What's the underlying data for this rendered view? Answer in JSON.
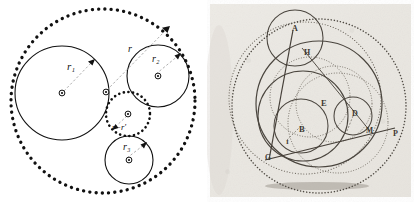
{
  "figure": {
    "panels": [
      "left-vector-diagram",
      "right-scanned-plate"
    ]
  },
  "left": {
    "name": "apollonian-radii-diagram",
    "stroke_color": "#111111",
    "dash_color": "#8a8a8a",
    "background": "#ffffff",
    "labels": {
      "r1": "r₁",
      "r2": "r₂",
      "r3": "r₃",
      "r_outer": "r",
      "r_middle": "r−r′"
    },
    "circles": [
      {
        "id": "outer-dotted",
        "label": "",
        "style": "dotted",
        "cx": 103,
        "cy": 101,
        "r": 92
      },
      {
        "id": "circle-r1",
        "label": "r₁",
        "style": "solid",
        "cx": 62,
        "cy": 93,
        "r": 47
      },
      {
        "id": "circle-r2",
        "label": "r₂",
        "style": "solid",
        "cx": 158,
        "cy": 76,
        "r": 31
      },
      {
        "id": "circle-r3",
        "label": "r₃",
        "style": "solid",
        "cx": 129,
        "cy": 160,
        "r": 24
      },
      {
        "id": "circle-middle-dotted",
        "label": "r−r′",
        "style": "dotted",
        "cx": 128,
        "cy": 114,
        "r": 22
      }
    ],
    "centers": [
      {
        "id": "center-r1",
        "cx": 62,
        "cy": 93
      },
      {
        "id": "center-outer",
        "cx": 106,
        "cy": 92
      },
      {
        "id": "center-r2",
        "cx": 158,
        "cy": 76
      },
      {
        "id": "center-middle",
        "cx": 128,
        "cy": 114
      },
      {
        "id": "center-r3",
        "cx": 129,
        "cy": 160
      }
    ]
  },
  "right": {
    "name": "scanned-geometric-plate",
    "background": "#f2f0ec",
    "ink_color": "#555049",
    "points": [
      {
        "label": "A",
        "x": 85,
        "y": 28
      },
      {
        "label": "H",
        "x": 97,
        "y": 52
      },
      {
        "label": "E",
        "x": 114,
        "y": 103
      },
      {
        "label": "B",
        "x": 94,
        "y": 129
      },
      {
        "label": "D",
        "x": 146,
        "y": 113
      },
      {
        "label": "M",
        "x": 160,
        "y": 130
      },
      {
        "label": "P",
        "x": 187,
        "y": 133
      },
      {
        "label": "G",
        "x": 60,
        "y": 157
      },
      {
        "label": "I",
        "x": 80,
        "y": 141
      }
    ]
  }
}
